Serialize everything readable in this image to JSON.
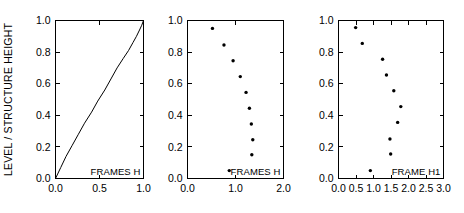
{
  "figure": {
    "ylabel": "LEVEL / STRUCTURE HEIGHT",
    "background": "#ffffff",
    "ink": "#000000"
  },
  "panels": [
    {
      "name": "panel-1",
      "label": "FRAMES H",
      "xticks": [
        "0.0",
        "0.5",
        "1.0"
      ],
      "yticks": [
        "0.0",
        "0.2",
        "0.4",
        "0.6",
        "0.8",
        "1.0"
      ],
      "show_yticklabels": true
    },
    {
      "name": "panel-2",
      "label": "FRAMES H",
      "xticks": [
        "0.0",
        "1.0",
        "2.0"
      ],
      "yticks": [
        "0.0",
        "0.2",
        "0.4",
        "0.6",
        "0.8",
        "1.0"
      ],
      "show_yticklabels": true
    },
    {
      "name": "panel-3",
      "label": "FRAME H1",
      "xticks": [
        "0.0",
        "0.5",
        "1.0",
        "1.5",
        "2.0",
        "2.5",
        "3.0"
      ],
      "yticks": [
        "0.0",
        "0.2",
        "0.4",
        "0.6",
        "0.8",
        "1.0"
      ],
      "show_yticklabels": true
    }
  ],
  "chart_data": [
    {
      "type": "line",
      "panel": "panel-1",
      "title": "",
      "annotation": "FRAMES H",
      "xlabel": "",
      "ylabel": "LEVEL / STRUCTURE HEIGHT",
      "xlim": [
        0.0,
        1.0
      ],
      "ylim": [
        0.0,
        1.0
      ],
      "xticks": [
        0.0,
        0.5,
        1.0
      ],
      "yticks": [
        0.0,
        0.2,
        0.4,
        0.6,
        0.8,
        1.0
      ],
      "grid": false,
      "legend": "none",
      "series": [
        {
          "name": "FRAMES H",
          "x": [
            0.0,
            0.06,
            0.12,
            0.19,
            0.26,
            0.33,
            0.41,
            0.48,
            0.56,
            0.63,
            0.7,
            0.77,
            0.83,
            0.88,
            0.92,
            0.955,
            0.98,
            1.0
          ],
          "y": [
            0.0,
            0.07,
            0.14,
            0.21,
            0.28,
            0.35,
            0.42,
            0.49,
            0.56,
            0.63,
            0.7,
            0.76,
            0.81,
            0.86,
            0.9,
            0.94,
            0.97,
            1.0
          ]
        }
      ]
    },
    {
      "type": "scatter",
      "panel": "panel-2",
      "title": "",
      "annotation": "FRAMES H",
      "xlabel": "",
      "ylabel": "LEVEL / STRUCTURE HEIGHT",
      "xlim": [
        0.0,
        2.0
      ],
      "ylim": [
        0.0,
        1.0
      ],
      "xticks": [
        0.0,
        1.0,
        2.0
      ],
      "yticks": [
        0.0,
        0.2,
        0.4,
        0.6,
        0.8,
        1.0
      ],
      "grid": false,
      "legend": "none",
      "series": [
        {
          "name": "FRAMES H",
          "x": [
            0.52,
            0.76,
            0.95,
            1.1,
            1.22,
            1.29,
            1.33,
            1.36,
            1.34,
            0.87
          ],
          "y": [
            0.95,
            0.845,
            0.745,
            0.645,
            0.545,
            0.445,
            0.345,
            0.245,
            0.15,
            0.05
          ]
        }
      ]
    },
    {
      "type": "scatter",
      "panel": "panel-3",
      "title": "",
      "annotation": "FRAME H1",
      "xlabel": "",
      "ylabel": "LEVEL / STRUCTURE HEIGHT",
      "xlim": [
        0.0,
        3.0
      ],
      "ylim": [
        0.0,
        1.0
      ],
      "xticks": [
        0.0,
        0.5,
        1.0,
        1.5,
        2.0,
        2.5,
        3.0
      ],
      "yticks": [
        0.0,
        0.2,
        0.4,
        0.6,
        0.8,
        1.0
      ],
      "grid": false,
      "legend": "none",
      "series": [
        {
          "name": "FRAME H1",
          "x": [
            0.49,
            0.68,
            1.26,
            1.37,
            1.58,
            1.78,
            1.69,
            1.47,
            1.49,
            0.91
          ],
          "y": [
            0.955,
            0.855,
            0.755,
            0.655,
            0.555,
            0.455,
            0.355,
            0.25,
            0.155,
            0.05
          ]
        }
      ]
    }
  ]
}
